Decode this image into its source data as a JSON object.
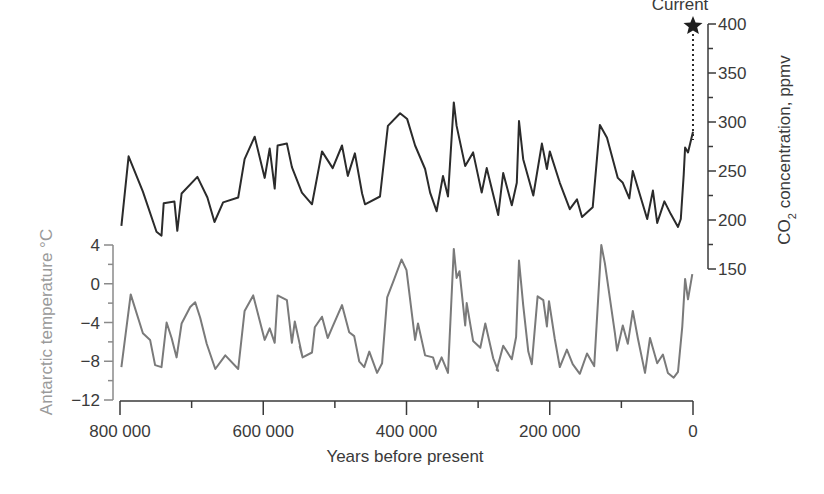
{
  "chart_data": {
    "type": "line",
    "title": "",
    "xlabel": "Years before present",
    "x_ticks": [
      800000,
      600000,
      400000,
      200000,
      0
    ],
    "x_tick_labels": [
      "800 000",
      "600 000",
      "400 000",
      "200 000",
      "0"
    ],
    "xlim": [
      800000,
      0
    ],
    "annotation": {
      "label": "Current",
      "marker": "star",
      "year": 0,
      "co2_ppmv": 395
    },
    "series": [
      {
        "name": "CO2 concentration",
        "axis": "right",
        "ylabel": "CO2 concentration, ppmv",
        "ylim": [
          150,
          400
        ],
        "y_ticks": [
          150,
          200,
          250,
          300,
          350,
          400
        ],
        "color": "#2b2b2b",
        "points": [
          [
            798,
            194
          ],
          [
            788,
            265
          ],
          [
            768,
            229
          ],
          [
            749,
            188
          ],
          [
            742,
            184
          ],
          [
            739,
            217
          ],
          [
            724,
            219
          ],
          [
            720,
            189
          ],
          [
            714,
            227
          ],
          [
            692,
            244
          ],
          [
            678,
            223
          ],
          [
            668,
            198
          ],
          [
            656,
            218
          ],
          [
            635,
            223
          ],
          [
            626,
            262
          ],
          [
            612,
            285
          ],
          [
            598,
            243
          ],
          [
            591,
            273
          ],
          [
            584,
            232
          ],
          [
            580,
            276
          ],
          [
            567,
            278
          ],
          [
            560,
            254
          ],
          [
            546,
            228
          ],
          [
            532,
            216
          ],
          [
            518,
            270
          ],
          [
            503,
            253
          ],
          [
            490,
            276
          ],
          [
            482,
            245
          ],
          [
            472,
            268
          ],
          [
            462,
            227
          ],
          [
            458,
            216
          ],
          [
            437,
            224
          ],
          [
            426,
            296
          ],
          [
            409,
            309
          ],
          [
            399,
            303
          ],
          [
            388,
            276
          ],
          [
            374,
            252
          ],
          [
            367,
            228
          ],
          [
            358,
            209
          ],
          [
            349,
            245
          ],
          [
            342,
            224
          ],
          [
            334,
            320
          ],
          [
            330,
            296
          ],
          [
            318,
            255
          ],
          [
            307,
            269
          ],
          [
            295,
            228
          ],
          [
            288,
            253
          ],
          [
            272,
            205
          ],
          [
            265,
            248
          ],
          [
            253,
            215
          ],
          [
            246,
            238
          ],
          [
            243,
            301
          ],
          [
            237,
            262
          ],
          [
            223,
            225
          ],
          [
            211,
            278
          ],
          [
            204,
            252
          ],
          [
            200,
            270
          ],
          [
            186,
            238
          ],
          [
            172,
            211
          ],
          [
            162,
            221
          ],
          [
            155,
            203
          ],
          [
            140,
            213
          ],
          [
            130,
            297
          ],
          [
            120,
            284
          ],
          [
            105,
            243
          ],
          [
            98,
            238
          ],
          [
            89,
            222
          ],
          [
            84,
            250
          ],
          [
            77,
            233
          ],
          [
            64,
            201
          ],
          [
            56,
            230
          ],
          [
            50,
            197
          ],
          [
            40,
            219
          ],
          [
            31,
            206
          ],
          [
            21,
            193
          ],
          [
            17,
            201
          ],
          [
            13,
            246
          ],
          [
            11,
            274
          ],
          [
            7,
            269
          ],
          [
            0,
            290
          ]
        ]
      },
      {
        "name": "Antarctic temperature",
        "axis": "left",
        "ylabel": "Antarctic temperature °C",
        "ylim": [
          -12,
          4
        ],
        "y_ticks": [
          -12,
          -8,
          -4,
          0,
          4
        ],
        "color": "#7a7a7a",
        "points": [
          [
            798,
            -8.6
          ],
          [
            785,
            -1.1
          ],
          [
            768,
            -5.1
          ],
          [
            758,
            -5.8
          ],
          [
            751,
            -8.4
          ],
          [
            742,
            -8.6
          ],
          [
            735,
            -4.0
          ],
          [
            728,
            -5.6
          ],
          [
            721,
            -7.6
          ],
          [
            714,
            -4.1
          ],
          [
            702,
            -2.4
          ],
          [
            695,
            -1.9
          ],
          [
            688,
            -3.5
          ],
          [
            679,
            -6.2
          ],
          [
            667,
            -8.8
          ],
          [
            653,
            -7.4
          ],
          [
            635,
            -8.8
          ],
          [
            626,
            -2.8
          ],
          [
            614,
            -1.2
          ],
          [
            598,
            -5.8
          ],
          [
            591,
            -4.6
          ],
          [
            584,
            -6.1
          ],
          [
            580,
            -1.2
          ],
          [
            567,
            -1.7
          ],
          [
            560,
            -6.1
          ],
          [
            556,
            -3.9
          ],
          [
            545,
            -7.6
          ],
          [
            549,
            -6.5
          ],
          [
            545,
            -7.6
          ],
          [
            532,
            -7.1
          ],
          [
            528,
            -4.5
          ],
          [
            518,
            -3.4
          ],
          [
            510,
            -5.6
          ],
          [
            503,
            -4.4
          ],
          [
            490,
            -2.2
          ],
          [
            480,
            -5.0
          ],
          [
            473,
            -5.4
          ],
          [
            466,
            -8.0
          ],
          [
            459,
            -8.6
          ],
          [
            452,
            -7.0
          ],
          [
            441,
            -9.2
          ],
          [
            434,
            -8.2
          ],
          [
            427,
            -1.4
          ],
          [
            417,
            0.5
          ],
          [
            407,
            2.5
          ],
          [
            400,
            1.4
          ],
          [
            388,
            -5.8
          ],
          [
            384,
            -4.1
          ],
          [
            374,
            -7.4
          ],
          [
            363,
            -7.6
          ],
          [
            358,
            -8.8
          ],
          [
            351,
            -7.6
          ],
          [
            342,
            -9.2
          ],
          [
            334,
            3.6
          ],
          [
            330,
            0.6
          ],
          [
            326,
            1.3
          ],
          [
            318,
            -4.3
          ],
          [
            316,
            -2.0
          ],
          [
            307,
            -5.9
          ],
          [
            297,
            -6.6
          ],
          [
            290,
            -4.1
          ],
          [
            279,
            -7.7
          ],
          [
            272,
            -9.0
          ],
          [
            274,
            -8.9
          ],
          [
            265,
            -6.4
          ],
          [
            253,
            -7.8
          ],
          [
            247,
            -5.5
          ],
          [
            243,
            2.4
          ],
          [
            237,
            -2.2
          ],
          [
            230,
            -7.0
          ],
          [
            225,
            -8.3
          ],
          [
            217,
            -1.3
          ],
          [
            209,
            -1.7
          ],
          [
            204,
            -4.4
          ],
          [
            201,
            -1.8
          ],
          [
            193,
            -5.7
          ],
          [
            186,
            -8.6
          ],
          [
            176,
            -6.8
          ],
          [
            168,
            -8.3
          ],
          [
            158,
            -9.3
          ],
          [
            148,
            -7.2
          ],
          [
            138,
            -8.5
          ],
          [
            128,
            4.0
          ],
          [
            123,
            2.1
          ],
          [
            116,
            -1.5
          ],
          [
            109,
            -5.1
          ],
          [
            106,
            -6.9
          ],
          [
            98,
            -4.3
          ],
          [
            91,
            -6.2
          ],
          [
            84,
            -2.8
          ],
          [
            77,
            -5.6
          ],
          [
            67,
            -9.2
          ],
          [
            60,
            -5.6
          ],
          [
            50,
            -8.2
          ],
          [
            42,
            -7.3
          ],
          [
            35,
            -9.2
          ],
          [
            27,
            -9.7
          ],
          [
            21,
            -9.1
          ],
          [
            15,
            -4.4
          ],
          [
            11,
            0.5
          ],
          [
            7,
            -1.6
          ],
          [
            1,
            1.0
          ]
        ]
      }
    ]
  },
  "labels": {
    "current": "Current",
    "x_axis_title": "Years before present",
    "left_axis_title": "Antarctic temperature °C",
    "right_axis_title_prefix": "CO",
    "right_axis_title_sub": "2",
    "right_axis_title_suffix": " concentration, ppmv"
  },
  "colors": {
    "co2_line": "#2b2b2b",
    "temp_line": "#7a7a7a",
    "axis_dark": "#3a3a3a",
    "axis_light": "#8a8a8a"
  }
}
